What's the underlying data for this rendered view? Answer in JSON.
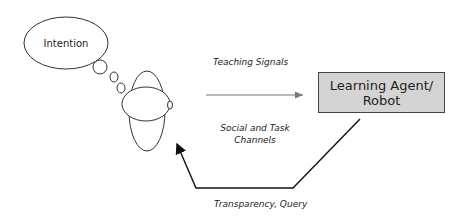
{
  "diagram": {
    "thought_bubble": {
      "label": "Intention"
    },
    "agent_box": {
      "line1": "Learning Agent/",
      "line2": "Robot",
      "fill": "#d4d4d4"
    },
    "edges": {
      "teaching_signals": "Teaching Signals",
      "channels_line1": "Social and Task",
      "channels_line2": "Channels",
      "transparency": "Transparency, Query"
    }
  }
}
